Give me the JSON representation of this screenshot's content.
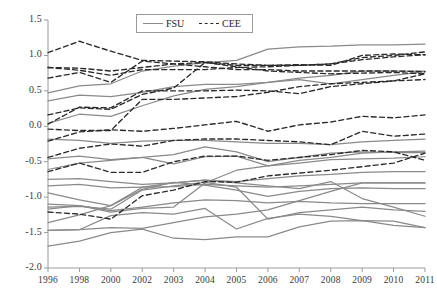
{
  "chart_data": {
    "type": "line",
    "title": "",
    "xlabel": "",
    "ylabel": "",
    "categories": [
      "1996",
      "1998",
      "2000",
      "2002",
      "2003",
      "2004",
      "2005",
      "2006",
      "2007",
      "2008",
      "2009",
      "2010",
      "2011"
    ],
    "ylim": [
      -2.0,
      1.5
    ],
    "yticks": [
      "1.5",
      "1.0",
      "0.5",
      "0.0",
      "-0.5",
      "-1.0",
      "-1.5",
      "-2.0"
    ],
    "ytick_values": [
      1.5,
      1.0,
      0.5,
      0.0,
      -0.5,
      -1.0,
      -1.5,
      -2.0
    ],
    "grid": false,
    "legend_position": "top-center",
    "legend": [
      {
        "name": "FSU",
        "style": "solid",
        "color": "#8a8a8a"
      },
      {
        "name": "CEE",
        "style": "dashed",
        "color": "#2b2b2b"
      }
    ],
    "series": [
      {
        "name": "FSU-1",
        "group": "FSU",
        "style": "solid",
        "color": "#8a8a8a",
        "values": [
          0.47,
          0.57,
          0.6,
          0.78,
          0.85,
          0.9,
          0.93,
          1.09,
          1.12,
          1.13,
          1.15,
          1.15,
          1.16
        ]
      },
      {
        "name": "FSU-2",
        "group": "FSU",
        "style": "solid",
        "color": "#8a8a8a",
        "values": [
          0.36,
          0.44,
          0.42,
          0.48,
          0.56,
          0.59,
          0.59,
          0.62,
          0.68,
          0.72,
          0.78,
          0.78,
          0.78
        ]
      },
      {
        "name": "FSU-3",
        "group": "FSU",
        "style": "solid",
        "color": "#8a8a8a",
        "values": [
          0.04,
          0.17,
          0.14,
          0.29,
          0.43,
          0.52,
          0.56,
          0.62,
          0.66,
          0.6,
          0.66,
          0.72,
          0.77
        ]
      },
      {
        "name": "FSU-4",
        "group": "FSU",
        "style": "solid",
        "color": "#8a8a8a",
        "values": [
          -0.18,
          -0.2,
          -0.24,
          -0.21,
          -0.2,
          -0.2,
          -0.22,
          -0.24,
          -0.24,
          -0.26,
          -0.22,
          -0.2,
          -0.18
        ]
      },
      {
        "name": "FSU-5",
        "group": "FSU",
        "style": "solid",
        "color": "#8a8a8a",
        "values": [
          -0.46,
          -0.42,
          -0.47,
          -0.44,
          -0.4,
          -0.29,
          -0.36,
          -0.5,
          -0.44,
          -0.38,
          -0.36,
          -0.37,
          -0.37
        ]
      },
      {
        "name": "FSU-6",
        "group": "FSU",
        "style": "solid",
        "color": "#8a8a8a",
        "values": [
          -0.61,
          -0.52,
          -0.48,
          -0.44,
          -0.53,
          -0.43,
          -0.42,
          -0.56,
          -0.52,
          -0.47,
          -0.46,
          -0.45,
          -0.43
        ]
      },
      {
        "name": "FSU-7",
        "group": "FSU",
        "style": "solid",
        "color": "#8a8a8a",
        "values": [
          -0.75,
          -0.74,
          -0.78,
          -0.82,
          -0.8,
          -0.76,
          -0.78,
          -0.74,
          -0.7,
          -0.68,
          -0.65,
          -0.64,
          -0.64
        ]
      },
      {
        "name": "FSU-8",
        "group": "FSU",
        "style": "solid",
        "color": "#8a8a8a",
        "values": [
          -0.84,
          -0.82,
          -0.87,
          -0.86,
          -0.85,
          -0.82,
          -0.84,
          -0.86,
          -0.84,
          -0.82,
          -0.8,
          -0.8,
          -0.8
        ]
      },
      {
        "name": "FSU-9",
        "group": "FSU",
        "style": "solid",
        "color": "#8a8a8a",
        "values": [
          -0.94,
          -1.04,
          -1.12,
          -0.89,
          -0.79,
          -0.83,
          -0.9,
          -0.99,
          -0.92,
          -0.88,
          -0.87,
          -0.88,
          -0.88
        ]
      },
      {
        "name": "FSU-10",
        "group": "FSU",
        "style": "solid",
        "color": "#8a8a8a",
        "values": [
          -1.1,
          -1.12,
          -1.19,
          -1.14,
          -1.08,
          -1.04,
          -1.05,
          -1.08,
          -1.06,
          -1.08,
          -1.09,
          -1.09,
          -1.09
        ]
      },
      {
        "name": "FSU-11",
        "group": "FSU",
        "style": "solid",
        "color": "#8a8a8a",
        "values": [
          -1.14,
          -1.13,
          -1.17,
          -0.9,
          -0.84,
          -0.79,
          -0.86,
          -1.31,
          -1.22,
          -1.18,
          -1.14,
          -1.18,
          -1.2
        ]
      },
      {
        "name": "FSU-12",
        "group": "FSU",
        "style": "solid",
        "color": "#8a8a8a",
        "values": [
          -1.17,
          -1.12,
          -1.21,
          -1.16,
          -1.14,
          -0.8,
          -0.62,
          -0.56,
          -0.48,
          -0.44,
          -0.38,
          -0.36,
          -0.35
        ]
      },
      {
        "name": "FSU-13",
        "group": "FSU",
        "style": "solid",
        "color": "#8a8a8a",
        "values": [
          -1.36,
          -1.25,
          -1.12,
          -0.86,
          -0.8,
          -0.76,
          -0.8,
          -0.84,
          -0.88,
          -0.78,
          -1.02,
          -1.14,
          -1.27
        ]
      },
      {
        "name": "FSU-14",
        "group": "FSU",
        "style": "solid",
        "color": "#8a8a8a",
        "values": [
          -1.47,
          -1.46,
          -1.26,
          -1.22,
          -1.24,
          -1.16,
          -1.45,
          -1.3,
          -1.24,
          -1.27,
          -1.33,
          -1.4,
          -1.43
        ]
      },
      {
        "name": "FSU-15",
        "group": "FSU",
        "style": "solid",
        "color": "#8a8a8a",
        "values": [
          -1.47,
          -1.46,
          -1.43,
          -1.44,
          -1.36,
          -1.28,
          -1.24,
          -1.18,
          -1.05,
          -0.92,
          -0.8,
          -0.8,
          -0.8
        ]
      },
      {
        "name": "FSU-16",
        "group": "FSU",
        "style": "solid",
        "color": "#8a8a8a",
        "values": [
          -1.69,
          -1.62,
          -1.5,
          -1.45,
          -1.58,
          -1.6,
          -1.56,
          -1.56,
          -1.42,
          -1.34,
          -1.33,
          -1.34,
          -1.43
        ]
      },
      {
        "name": "CEE-1",
        "group": "CEE",
        "style": "dashed",
        "color": "#2b2b2b",
        "values": [
          1.04,
          1.2,
          1.06,
          0.93,
          0.92,
          0.91,
          0.88,
          0.86,
          0.86,
          0.88,
          0.97,
          1.0,
          1.05
        ]
      },
      {
        "name": "CEE-2",
        "group": "CEE",
        "style": "dashed",
        "color": "#2b2b2b",
        "values": [
          0.83,
          0.82,
          0.78,
          0.83,
          0.88,
          0.9,
          0.86,
          0.86,
          0.87,
          0.86,
          1.0,
          1.02,
          1.01
        ]
      },
      {
        "name": "CEE-3",
        "group": "CEE",
        "style": "dashed",
        "color": "#2b2b2b",
        "values": [
          0.83,
          0.79,
          0.72,
          0.8,
          0.8,
          0.8,
          0.83,
          0.84,
          0.86,
          0.88,
          0.94,
          0.98,
          1.01
        ]
      },
      {
        "name": "CEE-4",
        "group": "CEE",
        "style": "dashed",
        "color": "#2b2b2b",
        "values": [
          0.68,
          0.76,
          0.62,
          0.92,
          0.88,
          0.84,
          0.8,
          0.8,
          0.78,
          0.78,
          0.78,
          0.78,
          0.77
        ]
      },
      {
        "name": "CEE-5",
        "group": "CEE",
        "style": "dashed",
        "color": "#2b2b2b",
        "values": [
          0.16,
          0.26,
          0.24,
          0.45,
          0.54,
          0.9,
          0.84,
          0.78,
          0.76,
          0.74,
          0.75,
          0.76,
          0.74
        ]
      },
      {
        "name": "CEE-6",
        "group": "CEE",
        "style": "dashed",
        "color": "#2b2b2b",
        "values": [
          0.03,
          0.27,
          0.26,
          0.5,
          0.5,
          0.5,
          0.51,
          0.5,
          0.46,
          0.56,
          0.6,
          0.64,
          0.66
        ]
      },
      {
        "name": "CEE-7",
        "group": "CEE",
        "style": "dashed",
        "color": "#2b2b2b",
        "values": [
          -0.04,
          -0.06,
          -0.06,
          0.38,
          0.38,
          0.4,
          0.42,
          0.48,
          0.56,
          0.6,
          0.62,
          0.64,
          0.74
        ]
      },
      {
        "name": "CEE-8",
        "group": "CEE",
        "style": "dashed",
        "color": "#2b2b2b",
        "values": [
          -0.21,
          -0.08,
          -0.05,
          -0.07,
          -0.03,
          0.02,
          0.07,
          -0.07,
          0.02,
          0.06,
          0.14,
          0.12,
          0.16
        ]
      },
      {
        "name": "CEE-9",
        "group": "CEE",
        "style": "dashed",
        "color": "#2b2b2b",
        "values": [
          -0.44,
          -0.31,
          -0.25,
          -0.28,
          -0.2,
          -0.18,
          -0.18,
          -0.2,
          -0.22,
          -0.26,
          -0.07,
          -0.14,
          -0.11
        ]
      },
      {
        "name": "CEE-10",
        "group": "CEE",
        "style": "dashed",
        "color": "#2b2b2b",
        "values": [
          -0.64,
          -0.52,
          -0.65,
          -0.65,
          -0.5,
          -0.42,
          -0.42,
          -0.48,
          -0.44,
          -0.4,
          -0.34,
          -0.36,
          -0.48
        ]
      },
      {
        "name": "CEE-11",
        "group": "CEE",
        "style": "dashed",
        "color": "#2b2b2b",
        "values": [
          -1.21,
          -1.24,
          -1.31,
          -0.98,
          -0.9,
          -0.78,
          -0.79,
          -0.7,
          -0.66,
          -0.62,
          -0.57,
          -0.52,
          -0.38
        ]
      }
    ]
  },
  "axis": {
    "tick_color": "#9a9a9a",
    "text_color": "#3a3a3a"
  }
}
